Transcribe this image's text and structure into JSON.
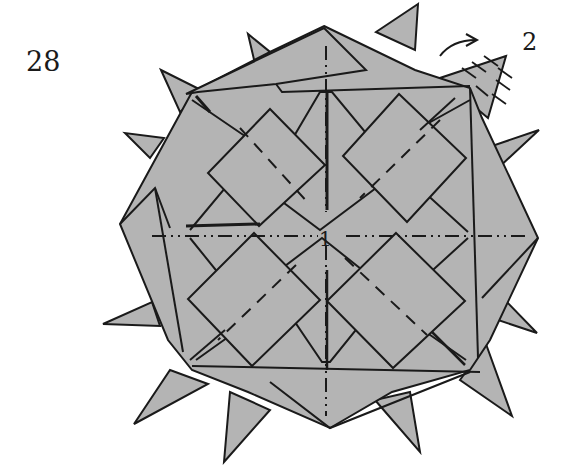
{
  "diagram": {
    "step_number": "28",
    "labels": {
      "center": "1",
      "corner": "2"
    },
    "colors": {
      "paper": "#b4b4b4",
      "line": "#1a1a1a",
      "background": "#ffffff"
    },
    "line_types": [
      "solid edge",
      "valley fold (dashed)",
      "mountain fold (dash-dot)"
    ],
    "symbols": [
      "curved-arrow",
      "repeat-hatch-marks"
    ]
  }
}
